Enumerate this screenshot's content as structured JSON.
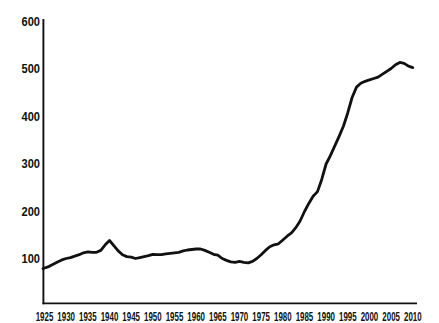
{
  "chart_data": {
    "type": "line",
    "title": "",
    "xlabel": "",
    "ylabel": "",
    "x": [
      1925,
      1926,
      1927,
      1928,
      1929,
      1930,
      1931,
      1932,
      1933,
      1934,
      1935,
      1936,
      1937,
      1938,
      1939,
      1940,
      1941,
      1942,
      1943,
      1944,
      1945,
      1946,
      1947,
      1948,
      1949,
      1950,
      1951,
      1952,
      1953,
      1954,
      1955,
      1956,
      1957,
      1958,
      1959,
      1960,
      1961,
      1962,
      1963,
      1964,
      1965,
      1966,
      1967,
      1968,
      1969,
      1970,
      1971,
      1972,
      1973,
      1974,
      1975,
      1976,
      1977,
      1978,
      1979,
      1980,
      1981,
      1982,
      1983,
      1984,
      1985,
      1986,
      1987,
      1988,
      1989,
      1990,
      1991,
      1992,
      1993,
      1994,
      1995,
      1996,
      1997,
      1998,
      1999,
      2000,
      2001,
      2002,
      2003,
      2004,
      2005,
      2006,
      2007,
      2008,
      2009,
      2010
    ],
    "values": [
      80,
      84,
      89,
      94,
      98,
      101,
      103,
      106,
      109,
      113,
      115,
      114,
      114,
      118,
      130,
      139,
      128,
      117,
      109,
      105,
      104,
      101,
      103,
      105,
      107,
      110,
      109,
      109,
      111,
      112,
      113,
      114,
      117,
      119,
      120,
      121,
      121,
      118,
      114,
      110,
      108,
      101,
      97,
      94,
      93,
      95,
      93,
      92,
      95,
      101,
      109,
      118,
      126,
      130,
      132,
      140,
      148,
      155,
      166,
      180,
      200,
      217,
      232,
      242,
      268,
      300,
      318,
      338,
      358,
      380,
      408,
      440,
      462,
      470,
      474,
      477,
      480,
      483,
      489,
      495,
      501,
      509,
      514,
      512,
      506,
      503
    ],
    "xlim": [
      1925,
      2010
    ],
    "ylim": [
      0,
      600
    ],
    "x_ticks": [
      "1925",
      "1930",
      "1935",
      "1940",
      "1945",
      "1950",
      "1955",
      "1960",
      "1965",
      "1970",
      "1975",
      "1980",
      "1985",
      "1990",
      "1995",
      "2000",
      "2005",
      "2010"
    ],
    "y_ticks": [
      "100",
      "200",
      "300",
      "400",
      "500",
      "600"
    ],
    "grid": false,
    "legend_position": "none",
    "line_color": "#111111",
    "axis_color": "#111111",
    "label_color": "#111111",
    "background_color": "#ffffff"
  }
}
